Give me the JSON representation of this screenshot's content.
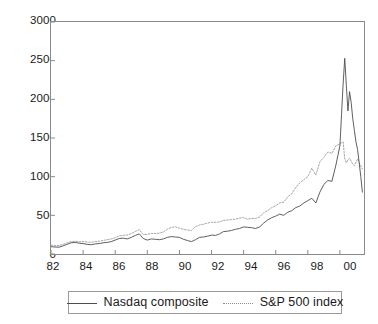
{
  "chart_data": {
    "type": "line",
    "title": "",
    "subtitle": "",
    "xlabel": "",
    "ylabel": "",
    "xlim": [
      1982.0,
      2001.5
    ],
    "ylim": [
      0,
      3000
    ],
    "grid": false,
    "legend_position": "bottom",
    "y_ticks": [
      0,
      500,
      1000,
      1500,
      2000,
      2500,
      3000
    ],
    "y_tick_labels": [
      "0",
      "500",
      "1000",
      "1500",
      "2000",
      "2500",
      "3000"
    ],
    "x_ticks": [
      1982,
      1984,
      1986,
      1988,
      1990,
      1992,
      1994,
      1996,
      1998,
      2000
    ],
    "x_tick_labels": [
      "82",
      "84",
      "86",
      "88",
      "90",
      "92",
      "94",
      "96",
      "98",
      "00"
    ],
    "x": [
      1982.0,
      1982.25,
      1982.5,
      1982.75,
      1983.0,
      1983.25,
      1983.5,
      1983.75,
      1984.0,
      1984.25,
      1984.5,
      1984.75,
      1985.0,
      1985.25,
      1985.5,
      1985.75,
      1986.0,
      1986.25,
      1986.5,
      1986.75,
      1987.0,
      1987.25,
      1987.5,
      1987.75,
      1988.0,
      1988.25,
      1988.5,
      1988.75,
      1989.0,
      1989.25,
      1989.5,
      1989.75,
      1990.0,
      1990.25,
      1990.5,
      1990.75,
      1991.0,
      1991.25,
      1991.5,
      1991.75,
      1992.0,
      1992.25,
      1992.5,
      1992.75,
      1993.0,
      1993.25,
      1993.5,
      1993.75,
      1994.0,
      1994.25,
      1994.5,
      1994.75,
      1995.0,
      1995.25,
      1995.5,
      1995.75,
      1996.0,
      1996.25,
      1996.5,
      1996.75,
      1997.0,
      1997.25,
      1997.5,
      1997.75,
      1998.0,
      1998.25,
      1998.5,
      1998.75,
      1999.0,
      1999.25,
      1999.5,
      1999.75,
      2000.0,
      2000.1,
      2000.2,
      2000.3,
      2000.4,
      2000.5,
      2000.6,
      2000.7,
      2000.8,
      2000.9,
      2001.0,
      2001.1,
      2001.2,
      2001.3,
      2001.4
    ],
    "series": [
      {
        "name": "Nasdaq composite",
        "style": "solid",
        "color": "#4d4d4d",
        "values": [
          95,
          90,
          88,
          105,
          125,
          145,
          150,
          140,
          135,
          125,
          120,
          130,
          135,
          145,
          150,
          160,
          180,
          200,
          205,
          195,
          215,
          240,
          260,
          200,
          180,
          195,
          190,
          185,
          195,
          215,
          225,
          220,
          215,
          190,
          175,
          160,
          185,
          215,
          220,
          230,
          245,
          240,
          260,
          290,
          295,
          305,
          320,
          330,
          350,
          345,
          340,
          330,
          350,
          400,
          440,
          470,
          490,
          515,
          500,
          540,
          560,
          600,
          620,
          660,
          690,
          720,
          660,
          800,
          900,
          950,
          940,
          1150,
          1400,
          1800,
          2200,
          2530,
          2180,
          1850,
          2100,
          1960,
          1750,
          1600,
          1450,
          1350,
          1180,
          1000,
          800
        ]
      },
      {
        "name": "S&P 500 index",
        "style": "dotted",
        "color": "#9a9a9a",
        "values": [
          115,
          110,
          108,
          125,
          145,
          160,
          165,
          160,
          160,
          155,
          150,
          160,
          165,
          175,
          185,
          195,
          210,
          235,
          240,
          245,
          265,
          290,
          315,
          250,
          255,
          265,
          265,
          270,
          285,
          320,
          345,
          350,
          335,
          320,
          310,
          305,
          355,
          375,
          385,
          400,
          410,
          410,
          415,
          435,
          440,
          445,
          450,
          465,
          470,
          450,
          460,
          460,
          480,
          535,
          560,
          600,
          625,
          660,
          670,
          740,
          780,
          860,
          920,
          960,
          1000,
          1110,
          1020,
          1190,
          1250,
          1320,
          1300,
          1400,
          1420,
          1440,
          1450,
          1230,
          1180,
          1220,
          1240,
          1200,
          1160,
          1140,
          1190,
          1230,
          1180,
          1140,
          1100
        ]
      }
    ],
    "annotations": []
  },
  "legend": {
    "items": [
      {
        "label": "Nasdaq composite",
        "style": "solid"
      },
      {
        "label": "S&P 500 index",
        "style": "dotted"
      }
    ]
  },
  "axes": {
    "y_labels": [
      "3000",
      "2500",
      "2000",
      "1500",
      "1000",
      "500",
      "0"
    ],
    "x_labels": [
      "82",
      "84",
      "86",
      "88",
      "90",
      "92",
      "94",
      "96",
      "98",
      "00"
    ]
  }
}
